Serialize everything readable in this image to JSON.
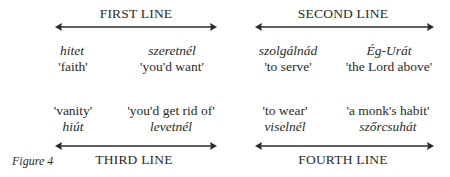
{
  "figure": {
    "caption": "Figure 4",
    "lines": [
      {
        "title": "FIRST LINE",
        "items": [
          {
            "word": "hitet",
            "gloss": "'faith'"
          },
          {
            "word": "szeretnél",
            "gloss": "'you'd want'"
          }
        ]
      },
      {
        "title": "SECOND LINE",
        "items": [
          {
            "word": "szolgálnád",
            "gloss": "'to serve'"
          },
          {
            "word": "Ég-Urát",
            "gloss": "'the Lord above'"
          }
        ]
      },
      {
        "title": "THIRD LINE",
        "items": [
          {
            "word": "hiút",
            "gloss": "'vanity'"
          },
          {
            "word": "levetnél",
            "gloss": "'you'd get rid of'"
          }
        ]
      },
      {
        "title": "FOURTH LINE",
        "items": [
          {
            "word": "viselnél",
            "gloss": "'to wear'"
          },
          {
            "word": "szőrcsuhát",
            "gloss": "'a monk's habit'"
          }
        ]
      }
    ],
    "arrow_color": "#2a2a2a"
  }
}
